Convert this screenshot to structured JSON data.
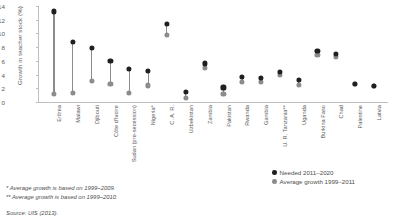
{
  "chart_data": {
    "type": "scatter",
    "title": "",
    "xlabel": "",
    "ylabel": "Growth in teacher stock (%)",
    "ylim": [
      0,
      14
    ],
    "yticks": [
      0,
      2,
      4,
      6,
      8,
      10,
      12,
      14
    ],
    "grid": false,
    "legend_position": "right-bottom",
    "categories": [
      "Eritrea",
      "Malawi",
      "Djibouti",
      "Côte d'Ivoire",
      "Sudan (pre-secession)",
      "Nigeria*",
      "C. A. R.",
      "Uzbekistan",
      "Zambia",
      "Pakistan",
      "Rwanda",
      "Gambia",
      "U. R. Tanzania**",
      "Uganda",
      "Burkina Faso",
      "Chad",
      "Palestine",
      "Latvia"
    ],
    "series": [
      {
        "name": "Needed 2011–2020",
        "color": "#231f20",
        "values": [
          13.2,
          8.7,
          7.9,
          6.0,
          4.8,
          4.5,
          11.4,
          1.4,
          5.6,
          2.1,
          3.6,
          3.5,
          4.4,
          3.2,
          7.4,
          7.0,
          2.6,
          2.3
        ]
      },
      {
        "name": "Average growth 1999–2011",
        "color": "#8c8c8c",
        "values": [
          1.1,
          1.3,
          3.1,
          2.6,
          1.3,
          2.4,
          9.8,
          0.6,
          4.9,
          1.1,
          2.9,
          2.9,
          3.9,
          2.5,
          6.9,
          6.6,
          2.6,
          2.3
        ]
      }
    ],
    "legend": [
      {
        "label": "Needed 2011–2020",
        "color": "#231f20"
      },
      {
        "label": "Average growth 1999–2011",
        "color": "#8c8c8c"
      }
    ]
  },
  "notes": {
    "note1": "* Average growth is based on 1999–2009.",
    "note2": "** Average growth is based on 1999–2010.",
    "source": "Source: UIS (2013)."
  }
}
